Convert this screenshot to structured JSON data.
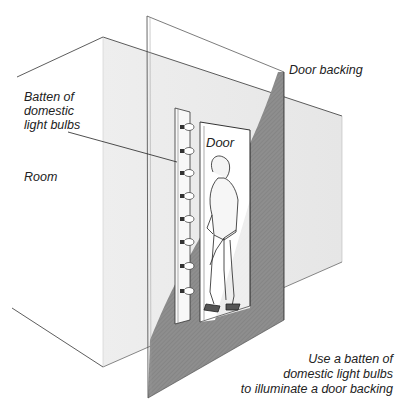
{
  "labels": {
    "batten": [
      "Batten of",
      "domestic",
      "light bulbs"
    ],
    "room": "Room",
    "door": "Door",
    "door_backing": "Door backing"
  },
  "caption": {
    "lines": [
      "Use a batten of",
      "domestic light bulbs",
      "to illuminate a door backing"
    ]
  },
  "colors": {
    "background": "#ffffff",
    "wall_fill": "#ececec",
    "backing_shadow": "#8f8f8f",
    "line": "#333333"
  },
  "batten": {
    "bulb_count": 8
  }
}
